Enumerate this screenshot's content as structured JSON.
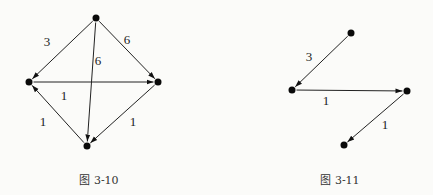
{
  "figures": [
    {
      "caption": "图 3-10",
      "nodes": [
        {
          "id": "top",
          "x": 96,
          "y": 18
        },
        {
          "id": "left",
          "x": 29,
          "y": 82
        },
        {
          "id": "right",
          "x": 158,
          "y": 82
        },
        {
          "id": "bottom",
          "x": 87,
          "y": 146
        }
      ],
      "edges": [
        {
          "from": "top",
          "to": "left",
          "weight": "3",
          "lx": 47,
          "ly": 46
        },
        {
          "from": "top",
          "to": "right",
          "weight": "6",
          "lx": 127,
          "ly": 44
        },
        {
          "from": "top",
          "to": "bottom",
          "weight": "6",
          "lx": 98,
          "ly": 65
        },
        {
          "from": "left",
          "to": "right",
          "weight": "1",
          "lx": 64,
          "ly": 100
        },
        {
          "from": "bottom",
          "to": "left",
          "weight": "1",
          "lx": 43,
          "ly": 126
        },
        {
          "from": "right",
          "to": "bottom",
          "weight": "1",
          "lx": 133,
          "ly": 126
        }
      ]
    },
    {
      "caption": "图 3-11",
      "nodes": [
        {
          "id": "top",
          "x": 351,
          "y": 33
        },
        {
          "id": "left",
          "x": 292,
          "y": 90
        },
        {
          "id": "right",
          "x": 407,
          "y": 91
        },
        {
          "id": "bottom",
          "x": 344,
          "y": 145
        }
      ],
      "edges": [
        {
          "from": "top",
          "to": "left",
          "weight": "3",
          "lx": 309,
          "ly": 61
        },
        {
          "from": "left",
          "to": "right",
          "weight": "1",
          "lx": 326,
          "ly": 105
        },
        {
          "from": "right",
          "to": "bottom",
          "weight": "1",
          "lx": 385,
          "ly": 129
        }
      ]
    }
  ]
}
